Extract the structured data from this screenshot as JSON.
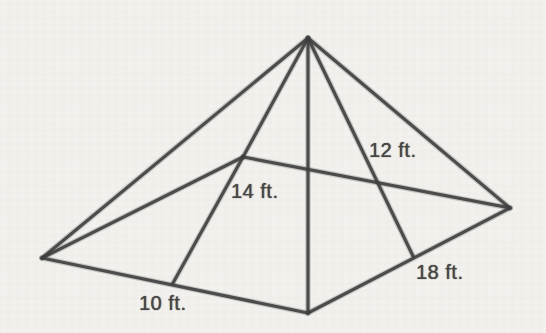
{
  "page": {
    "background": "#f3f2ee"
  },
  "figure": {
    "kind": "pyramid-surface-diagram",
    "stroke_color": "#3e3e3e",
    "stroke_width": 3.2,
    "halo_width": 5.6,
    "vertices": {
      "apex": [
        308,
        38
      ],
      "base_left": [
        42,
        258
      ],
      "base_front": [
        308,
        313
      ],
      "base_right": [
        510,
        208
      ],
      "base_back": [
        243,
        157
      ],
      "mid_front_left": [
        173,
        283
      ],
      "mid_front_right": [
        413,
        256
      ]
    },
    "edges": [
      [
        "apex",
        "base_left"
      ],
      [
        "apex",
        "base_front"
      ],
      [
        "apex",
        "base_right"
      ],
      [
        "apex",
        "base_back"
      ],
      [
        "base_back",
        "base_left"
      ],
      [
        "base_back",
        "base_right"
      ],
      [
        "base_left",
        "base_front"
      ],
      [
        "base_front",
        "base_right"
      ],
      [
        "base_back",
        "mid_front_left"
      ],
      [
        "apex",
        "mid_front_right"
      ]
    ],
    "labels": [
      {
        "name": "label-slant-right",
        "text": "12 ft.",
        "x": 369,
        "y": 140
      },
      {
        "name": "label-slant-left",
        "text": "14 ft.",
        "x": 231,
        "y": 181
      },
      {
        "name": "label-base-front-left",
        "text": "10 ft.",
        "x": 139,
        "y": 293
      },
      {
        "name": "label-base-front-right",
        "text": "18 ft.",
        "x": 416,
        "y": 262
      }
    ]
  }
}
